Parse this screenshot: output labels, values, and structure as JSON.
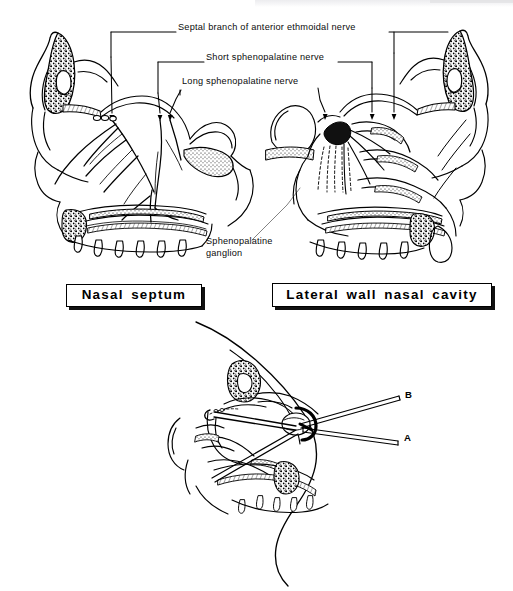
{
  "figure": {
    "style": "black and white anatomical line drawing",
    "background_color": "#ffffff",
    "ink_color": "#000000"
  },
  "upper_panel": {
    "nerve_labels": [
      {
        "id": "septal-branch",
        "text": "Septal branch of anterior ethmoidal nerve"
      },
      {
        "id": "short-sphenopalatine",
        "text": "Short sphenopalatine nerve"
      },
      {
        "id": "long-sphenopalatine",
        "text": "Long sphenopalatine nerve"
      }
    ],
    "ganglion_label": {
      "line1": "Sphenopalatine",
      "line2": "ganglion"
    },
    "captions": [
      {
        "id": "nasal-septum",
        "text": "Nasal septum"
      },
      {
        "id": "lateral-wall",
        "text": "Lateral wall nasal cavity"
      }
    ]
  },
  "lower_panel": {
    "pointer_labels": [
      {
        "id": "approach-b",
        "text": "B"
      },
      {
        "id": "approach-a",
        "text": "A"
      }
    ]
  }
}
